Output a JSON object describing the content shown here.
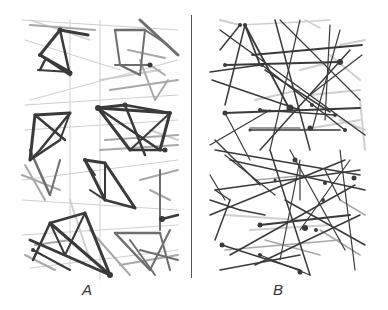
{
  "figure": {
    "panels": [
      {
        "id": "A",
        "label": "A",
        "description": "clustered network — dense triangular clusters with thick dark edges"
      },
      {
        "id": "B",
        "label": "B",
        "description": "random network — long edges spanning the panel"
      }
    ],
    "colors": {
      "dark": "#3a3a3a",
      "mid": "#6e6e6e",
      "light": "#a8a8a8",
      "pale": "#cfcfcf",
      "divider": "#555555"
    }
  },
  "panelA": {
    "lines": [
      [
        30,
        20,
        90,
        40,
        "pale",
        1.5
      ],
      [
        30,
        25,
        95,
        30,
        "light",
        2
      ],
      [
        60,
        30,
        88,
        35,
        "dark",
        3
      ],
      [
        40,
        55,
        60,
        30,
        "dark",
        3
      ],
      [
        40,
        55,
        70,
        75,
        "dark",
        2.5
      ],
      [
        60,
        30,
        70,
        75,
        "dark",
        2.5
      ],
      [
        40,
        55,
        70,
        72,
        "dark",
        3
      ],
      [
        38,
        70,
        70,
        72,
        "dark",
        2
      ],
      [
        45,
        60,
        40,
        70,
        "dark",
        2.5
      ],
      [
        25,
        40,
        120,
        70,
        "pale",
        1
      ],
      [
        22,
        20,
        178,
        30,
        "pale",
        1
      ],
      [
        30,
        100,
        178,
        60,
        "pale",
        1
      ],
      [
        25,
        105,
        178,
        95,
        "pale",
        1
      ],
      [
        25,
        130,
        178,
        120,
        "pale",
        1
      ],
      [
        100,
        20,
        100,
        280,
        "pale",
        1
      ],
      [
        70,
        20,
        70,
        270,
        "pale",
        1
      ],
      [
        22,
        180,
        178,
        160,
        "pale",
        1
      ],
      [
        22,
        200,
        178,
        210,
        "pale",
        1
      ],
      [
        115,
        30,
        145,
        30,
        "mid",
        2.5
      ],
      [
        115,
        30,
        120,
        65,
        "mid",
        2
      ],
      [
        145,
        30,
        168,
        45,
        "mid",
        2
      ],
      [
        145,
        30,
        140,
        75,
        "mid",
        2
      ],
      [
        115,
        65,
        150,
        65,
        "mid",
        2
      ],
      [
        120,
        65,
        140,
        75,
        "mid",
        2
      ],
      [
        140,
        20,
        178,
        55,
        "mid",
        3
      ],
      [
        150,
        65,
        165,
        75,
        "light",
        2
      ],
      [
        128,
        50,
        165,
        58,
        "light",
        2
      ],
      [
        140,
        60,
        155,
        100,
        "light",
        2
      ],
      [
        155,
        100,
        168,
        80,
        "light",
        2
      ],
      [
        110,
        90,
        178,
        80,
        "light",
        2
      ],
      [
        100,
        80,
        160,
        70,
        "pale",
        2
      ],
      [
        35,
        115,
        70,
        113,
        "dark",
        3
      ],
      [
        35,
        115,
        30,
        160,
        "dark",
        3
      ],
      [
        70,
        113,
        40,
        150,
        "dark",
        2.5
      ],
      [
        35,
        115,
        65,
        140,
        "dark",
        2.5
      ],
      [
        30,
        160,
        60,
        140,
        "dark",
        2.5
      ],
      [
        60,
        140,
        70,
        113,
        "dark",
        2
      ],
      [
        30,
        160,
        40,
        150,
        "dark",
        2
      ],
      [
        98,
        108,
        125,
        105,
        "dark",
        3
      ],
      [
        98,
        108,
        170,
        113,
        "dark",
        3
      ],
      [
        125,
        105,
        170,
        113,
        "dark",
        2.5
      ],
      [
        98,
        108,
        130,
        150,
        "dark",
        3
      ],
      [
        170,
        113,
        160,
        150,
        "dark",
        3
      ],
      [
        98,
        108,
        160,
        150,
        "dark",
        2.5
      ],
      [
        125,
        105,
        145,
        155,
        "dark",
        2.5
      ],
      [
        130,
        150,
        165,
        150,
        "dark",
        2.5
      ],
      [
        170,
        113,
        130,
        150,
        "dark",
        2
      ],
      [
        105,
        140,
        178,
        135,
        "light",
        2
      ],
      [
        100,
        150,
        178,
        145,
        "light",
        2
      ],
      [
        150,
        130,
        178,
        140,
        "pale",
        2
      ],
      [
        85,
        160,
        105,
        163,
        "dark",
        3
      ],
      [
        85,
        160,
        105,
        200,
        "dark",
        3
      ],
      [
        105,
        163,
        135,
        208,
        "dark",
        3
      ],
      [
        105,
        200,
        135,
        208,
        "dark",
        2.5
      ],
      [
        105,
        163,
        105,
        200,
        "dark",
        2
      ],
      [
        85,
        160,
        95,
        175,
        "dark",
        2
      ],
      [
        90,
        190,
        105,
        200,
        "dark",
        2
      ],
      [
        30,
        150,
        50,
        195,
        "mid",
        2.5
      ],
      [
        50,
        195,
        60,
        160,
        "mid",
        2
      ],
      [
        25,
        165,
        45,
        200,
        "light",
        2
      ],
      [
        22,
        175,
        60,
        190,
        "light",
        2
      ],
      [
        140,
        180,
        178,
        170,
        "light",
        2
      ],
      [
        150,
        190,
        170,
        200,
        "light",
        2
      ],
      [
        160,
        170,
        160,
        230,
        "mid",
        2
      ],
      [
        162,
        219,
        178,
        215,
        "dark",
        2.5
      ],
      [
        50,
        223,
        85,
        213,
        "dark",
        2.5
      ],
      [
        50,
        223,
        33,
        260,
        "dark",
        2.5
      ],
      [
        85,
        213,
        110,
        275,
        "dark",
        3
      ],
      [
        50,
        223,
        110,
        275,
        "dark",
        3
      ],
      [
        30,
        240,
        110,
        275,
        "dark",
        3
      ],
      [
        50,
        223,
        65,
        255,
        "dark",
        2
      ],
      [
        65,
        255,
        85,
        213,
        "dark",
        2
      ],
      [
        33,
        250,
        70,
        270,
        "dark",
        2
      ],
      [
        35,
        245,
        70,
        240,
        "light",
        2
      ],
      [
        115,
        233,
        160,
        233,
        "mid",
        2.5
      ],
      [
        115,
        233,
        150,
        270,
        "mid",
        2.5
      ],
      [
        130,
        240,
        155,
        275,
        "mid",
        2
      ],
      [
        160,
        233,
        170,
        270,
        "mid",
        2
      ],
      [
        140,
        250,
        178,
        260,
        "mid",
        2
      ],
      [
        120,
        265,
        178,
        255,
        "light",
        2
      ],
      [
        150,
        270,
        170,
        230,
        "mid",
        2
      ],
      [
        25,
        255,
        55,
        270,
        "light",
        2
      ],
      [
        30,
        268,
        178,
        250,
        "pale",
        1
      ],
      [
        22,
        235,
        178,
        225,
        "pale",
        1
      ],
      [
        90,
        230,
        130,
        275,
        "light",
        2
      ],
      [
        70,
        200,
        90,
        260,
        "pale",
        2
      ]
    ],
    "nodes": [
      [
        60,
        30,
        2.5
      ],
      [
        40,
        55,
        2
      ],
      [
        70,
        73,
        2.5
      ],
      [
        98,
        108,
        3
      ],
      [
        125,
        105,
        2.5
      ],
      [
        170,
        113,
        2
      ],
      [
        165,
        150,
        2.5
      ],
      [
        150,
        65,
        2.5
      ],
      [
        162,
        219,
        3
      ],
      [
        110,
        275,
        3
      ],
      [
        33,
        250,
        2
      ],
      [
        85,
        160,
        2
      ]
    ]
  },
  "panelB": {
    "lines": [
      [
        220,
        20,
        240,
        25,
        "pale",
        2
      ],
      [
        240,
        25,
        300,
        22,
        "pale",
        1.5
      ],
      [
        300,
        22,
        330,
        20,
        "pale",
        1.5
      ],
      [
        305,
        20,
        320,
        28,
        "pale",
        1.5
      ],
      [
        340,
        45,
        365,
        40,
        "pale",
        2
      ],
      [
        330,
        55,
        360,
        80,
        "pale",
        2
      ],
      [
        300,
        70,
        340,
        60,
        "pale",
        2
      ],
      [
        310,
        95,
        360,
        90,
        "pale",
        2
      ],
      [
        255,
        100,
        300,
        90,
        "pale",
        2
      ],
      [
        360,
        100,
        365,
        150,
        "pale",
        2
      ],
      [
        340,
        120,
        365,
        130,
        "pale",
        2
      ],
      [
        300,
        130,
        360,
        120,
        "pale",
        2
      ],
      [
        245,
        25,
        260,
        65,
        "dark",
        1.8
      ],
      [
        245,
        25,
        290,
        110,
        "dark",
        1.8
      ],
      [
        245,
        25,
        225,
        105,
        "dark",
        1.5
      ],
      [
        252,
        55,
        362,
        45,
        "dark",
        1.8
      ],
      [
        220,
        50,
        240,
        25,
        "dark",
        1.5
      ],
      [
        210,
        72,
        260,
        65,
        "dark",
        1.5
      ],
      [
        225,
        65,
        340,
        62,
        "dark",
        1.8
      ],
      [
        212,
        80,
        300,
        110,
        "dark",
        1.5
      ],
      [
        262,
        65,
        345,
        130,
        "dark",
        1.5
      ],
      [
        265,
        70,
        330,
        112,
        "dark",
        1.5
      ],
      [
        220,
        30,
        365,
        135,
        "dark",
        1.5
      ],
      [
        280,
        20,
        360,
        100,
        "dark",
        1.2
      ],
      [
        275,
        20,
        310,
        150,
        "dark",
        1.5
      ],
      [
        300,
        20,
        270,
        150,
        "dark",
        1.2
      ],
      [
        330,
        25,
        325,
        120,
        "dark",
        1.2
      ],
      [
        340,
        30,
        312,
        130,
        "dark",
        1.2
      ],
      [
        350,
        50,
        260,
        150,
        "dark",
        1.5
      ],
      [
        362,
        55,
        310,
        95,
        "dark",
        1.2
      ],
      [
        225,
        113,
        360,
        108,
        "dark",
        1.8
      ],
      [
        260,
        110,
        335,
        115,
        "dark",
        1.5
      ],
      [
        250,
        130,
        340,
        130,
        "dark",
        1.5
      ],
      [
        250,
        128,
        300,
        128,
        "dark",
        1.2
      ],
      [
        210,
        145,
        270,
        110,
        "dark",
        1.2
      ],
      [
        225,
        113,
        250,
        160,
        "dark",
        1.2
      ],
      [
        215,
        140,
        260,
        185,
        "dark",
        1.5
      ],
      [
        215,
        150,
        360,
        175,
        "dark",
        1.5
      ],
      [
        230,
        160,
        365,
        190,
        "dark",
        1.5
      ],
      [
        215,
        190,
        360,
        170,
        "dark",
        1.5
      ],
      [
        210,
        200,
        240,
        210,
        "dark",
        1.5
      ],
      [
        240,
        210,
        265,
        215,
        "dark",
        1.5
      ],
      [
        225,
        155,
        275,
        195,
        "dark",
        1.2
      ],
      [
        270,
        150,
        310,
        275,
        "dark",
        1.5
      ],
      [
        290,
        150,
        345,
        250,
        "dark",
        1.2
      ],
      [
        340,
        150,
        355,
        270,
        "dark",
        1.2
      ],
      [
        300,
        160,
        280,
        260,
        "dark",
        1.2
      ],
      [
        350,
        160,
        300,
        230,
        "dark",
        1.2
      ],
      [
        210,
        215,
        345,
        160,
        "dark",
        1.5
      ],
      [
        230,
        255,
        355,
        185,
        "dark",
        1.5
      ],
      [
        260,
        225,
        350,
        215,
        "dark",
        1.8
      ],
      [
        255,
        265,
        360,
        215,
        "dark",
        1.5
      ],
      [
        220,
        270,
        300,
        255,
        "dark",
        1.5
      ],
      [
        222,
        245,
        300,
        270,
        "dark",
        1.5
      ],
      [
        260,
        255,
        310,
        275,
        "dark",
        1.2
      ],
      [
        285,
        200,
        365,
        245,
        "dark",
        1.5
      ],
      [
        215,
        190,
        230,
        200,
        "dark",
        1.5
      ],
      [
        215,
        240,
        230,
        200,
        "dark",
        1.5
      ],
      [
        210,
        175,
        225,
        200,
        "dark",
        1.2
      ],
      [
        300,
        165,
        300,
        200,
        "dark",
        1.2
      ],
      [
        325,
        170,
        340,
        200,
        "dark",
        1.2
      ],
      [
        225,
        215,
        300,
        220,
        "pale",
        2
      ],
      [
        250,
        230,
        330,
        225,
        "pale",
        2
      ],
      [
        225,
        250,
        340,
        240,
        "light",
        1.5
      ],
      [
        265,
        240,
        320,
        255,
        "light",
        1.5
      ],
      [
        320,
        230,
        360,
        255,
        "light",
        1.5
      ],
      [
        340,
        200,
        365,
        215,
        "light",
        1.5
      ],
      [
        255,
        180,
        310,
        175,
        "light",
        1.5
      ]
    ],
    "nodes": [
      [
        245,
        25,
        2
      ],
      [
        262,
        65,
        2
      ],
      [
        240,
        25,
        2
      ],
      [
        225,
        65,
        2
      ],
      [
        340,
        62,
        3
      ],
      [
        290,
        108,
        3.5
      ],
      [
        312,
        105,
        2
      ],
      [
        335,
        115,
        2
      ],
      [
        260,
        110,
        2
      ],
      [
        225,
        113,
        2.5
      ],
      [
        310,
        128,
        2.5
      ],
      [
        250,
        130,
        1.5
      ],
      [
        345,
        130,
        2
      ],
      [
        354,
        178,
        2.5
      ],
      [
        260,
        225,
        2.5
      ],
      [
        305,
        228,
        3
      ],
      [
        325,
        183,
        2
      ],
      [
        222,
        245,
        2.5
      ],
      [
        260,
        255,
        2
      ],
      [
        300,
        272,
        2.5
      ],
      [
        295,
        160,
        2.5
      ],
      [
        275,
        180,
        1.5
      ],
      [
        323,
        200,
        2
      ],
      [
        316,
        230,
        2
      ]
    ]
  }
}
